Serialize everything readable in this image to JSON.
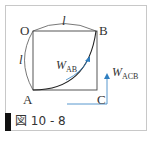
{
  "figure": {
    "points": {
      "O": "O",
      "A": "A",
      "B": "B",
      "C": "C"
    },
    "length_labels": {
      "top": "l",
      "left": "l"
    },
    "work_labels": {
      "ab": {
        "main": "W",
        "sub": "AB"
      },
      "acb": {
        "main": "W",
        "sub": "ACB"
      }
    },
    "colors": {
      "line": "#333333",
      "arrow": "#2f7fc1",
      "frame": "#c8c8c8",
      "caption_bar": "#111111"
    }
  },
  "caption": {
    "label": "図 10 - 8"
  }
}
